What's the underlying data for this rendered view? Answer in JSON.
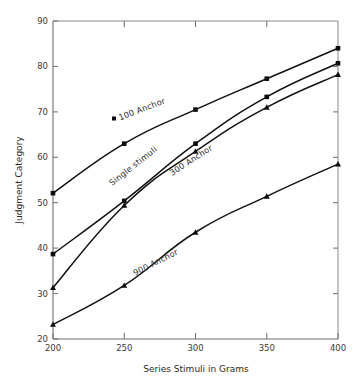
{
  "chart_data": {
    "type": "line",
    "title": "",
    "xlabel": "Series Stimuli in Grams",
    "ylabel": "Judgment Category",
    "xlim": [
      200,
      400
    ],
    "ylim": [
      20,
      90
    ],
    "xticks": [
      200,
      250,
      300,
      350,
      400
    ],
    "yticks": [
      20,
      30,
      40,
      50,
      60,
      70,
      80,
      90
    ],
    "grid": false,
    "legend": "inline-curve-labels",
    "x": [
      200,
      250,
      300,
      350,
      400
    ],
    "series": [
      {
        "name": "100 Anchor",
        "marker": "square",
        "values": [
          52.1,
          63.0,
          70.5,
          77.3,
          84.0
        ]
      },
      {
        "name": "Single stimuli",
        "marker": "square",
        "values": [
          38.7,
          50.4,
          63.0,
          73.3,
          80.7
        ]
      },
      {
        "name": "300 Anchor",
        "marker": "triangle",
        "values": [
          31.3,
          49.4,
          61.3,
          71.0,
          78.2
        ]
      },
      {
        "name": "900 Anchor",
        "marker": "triangle",
        "values": [
          23.2,
          31.8,
          43.5,
          51.4,
          58.5
        ]
      }
    ],
    "annotations": [
      {
        "text": "100 Anchor",
        "marker": "square",
        "rotation": -21
      },
      {
        "text": "Single stimuli",
        "marker": "none",
        "rotation": -38
      },
      {
        "text": "300 Anchor",
        "marker": "none",
        "rotation": -33
      },
      {
        "text": "900 Anchor",
        "marker": "none",
        "rotation": -27
      }
    ],
    "tick_labels": {
      "x": [
        "200",
        "250",
        "300",
        "350",
        "400"
      ],
      "y": [
        "20",
        "30",
        "40",
        "50",
        "60",
        "70",
        "80",
        "90"
      ]
    },
    "colors": {
      "curve": "#111111",
      "marker": "#0d0d0d",
      "axis": "#6e6e6e",
      "frame": "#8a8a8a",
      "text": "#2b2b2b",
      "background": "#ffffff"
    }
  }
}
